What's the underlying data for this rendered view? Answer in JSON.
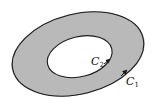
{
  "diagram": {
    "type": "annular-region",
    "colors": {
      "region_fill": "#b9b9b9",
      "hole_fill": "#ffffff",
      "stroke": "#1a1a1a"
    },
    "curves": [
      {
        "id": "C1",
        "label_main": "C",
        "label_sub": "1",
        "role": "outer boundary"
      },
      {
        "id": "C2",
        "label_main": "C",
        "label_sub": "2",
        "role": "inner boundary"
      }
    ]
  }
}
